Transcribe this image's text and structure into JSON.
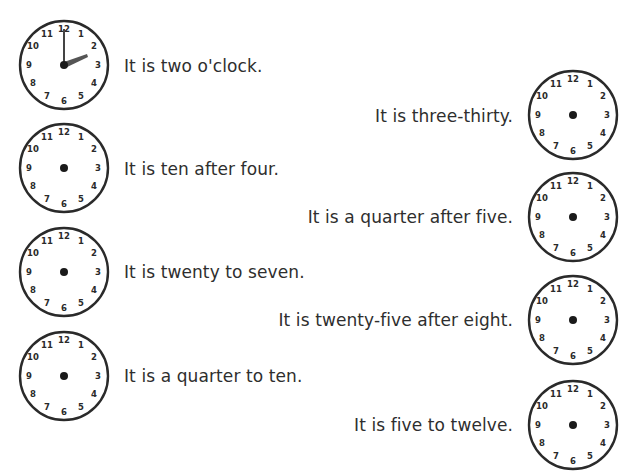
{
  "worksheet": {
    "colors": {
      "ink": "#2a2a2a",
      "hand": "#555555",
      "background": "#ffffff"
    },
    "clock_numbers": [
      "12",
      "1",
      "2",
      "3",
      "4",
      "5",
      "6",
      "7",
      "8",
      "9",
      "10",
      "11"
    ],
    "left_items": [
      {
        "text": "It is two o'clock.",
        "hands_drawn": true,
        "hour": 2,
        "minute": 0
      },
      {
        "text": "It is ten after four.",
        "hands_drawn": false
      },
      {
        "text": "It is twenty to seven.",
        "hands_drawn": false
      },
      {
        "text": "It is a quarter to ten.",
        "hands_drawn": false
      }
    ],
    "right_items": [
      {
        "text": "It is three-thirty.",
        "hands_drawn": false
      },
      {
        "text": "It is a quarter after five.",
        "hands_drawn": false
      },
      {
        "text": "It is twenty-five after eight.",
        "hands_drawn": false
      },
      {
        "text": "It is five to twelve.",
        "hands_drawn": false
      }
    ]
  }
}
